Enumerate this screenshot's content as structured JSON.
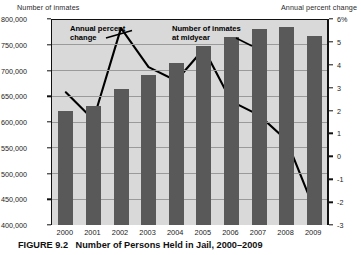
{
  "figure": {
    "caption_label": "FIGURE 9.2",
    "caption_title": "Number of Persons Held in Jail, 2000–2009"
  },
  "axis_titles": {
    "left": "Number of inmates",
    "right": "Annual percent change"
  },
  "annotations": [
    {
      "name": "annual-percent-change",
      "line1": "Annual percent",
      "line2": "change"
    },
    {
      "name": "number-of-inmates-at-midyear",
      "line1": "Number of inmates",
      "line2": "at midyear"
    }
  ],
  "chart_data": {
    "type": "bar",
    "xlabel": "",
    "ylabel": "Number of inmates",
    "y2label": "Annual percent change",
    "grid": true,
    "legend_position": "in-plot annotations",
    "categories": [
      "2000",
      "2001",
      "2002",
      "2003",
      "2004",
      "2005",
      "2006",
      "2007",
      "2008",
      "2009"
    ],
    "ylim": [
      400000,
      800000
    ],
    "yticks": [
      "400,000",
      "450,000",
      "500,000",
      "550,000",
      "600,000",
      "650,000",
      "700,000",
      "750,000",
      "800,000"
    ],
    "ytick_values": [
      400000,
      450000,
      500000,
      550000,
      600000,
      650000,
      700000,
      750000,
      800000
    ],
    "y2lim": [
      -3,
      6
    ],
    "y2ticks": [
      "-3",
      "-2",
      "-1",
      "0",
      "1",
      "2",
      "3",
      "4",
      "5",
      "6%"
    ],
    "y2tick_values": [
      -3,
      -2,
      -1,
      0,
      1,
      2,
      3,
      4,
      5,
      6
    ],
    "series": [
      {
        "name": "Number of inmates at midyear",
        "type": "bar",
        "axis": "left",
        "color": "#595959",
        "values": [
          621000,
          631000,
          665000,
          691000,
          714000,
          747000,
          765000,
          780000,
          785000,
          767000
        ]
      },
      {
        "name": "Annual percent change",
        "type": "line",
        "axis": "right",
        "color": "#000000",
        "values": [
          2.8,
          1.6,
          5.6,
          3.9,
          3.3,
          4.7,
          2.4,
          1.8,
          0.7,
          -2.3
        ]
      }
    ]
  }
}
